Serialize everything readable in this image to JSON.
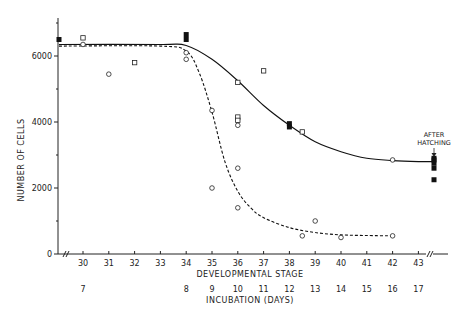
{
  "chart_data": {
    "type": "scatter",
    "title": "",
    "ylabel": "NUMBER OF CELLS",
    "xlabel": "DEVELOPMENTAL STAGE",
    "x2label": "INCUBATION (DAYS)",
    "ylim": [
      0,
      7000
    ],
    "yticks": [
      0,
      2000,
      4000,
      6000
    ],
    "yticks_minor": [
      1000,
      3000,
      5000,
      7000
    ],
    "xticks": [
      30,
      31,
      32,
      33,
      34,
      35,
      36,
      37,
      38,
      39,
      40,
      41,
      42,
      43
    ],
    "incubation_days": [
      {
        "stage": 30,
        "day": "7"
      },
      {
        "stage": 34,
        "day": "8"
      },
      {
        "stage": 35,
        "day": "9"
      },
      {
        "stage": 36,
        "day": "10"
      },
      {
        "stage": 37,
        "day": "11"
      },
      {
        "stage": 38,
        "day": "12"
      },
      {
        "stage": 39,
        "day": "13"
      },
      {
        "stage": 40,
        "day": "14"
      },
      {
        "stage": 41,
        "day": "15"
      },
      {
        "stage": 42,
        "day": "16"
      },
      {
        "stage": 43,
        "day": "17"
      }
    ],
    "grid": false,
    "annotation": {
      "text_line1": "AFTER",
      "text_line2": "HATCHING"
    },
    "series": [
      {
        "name": "filled squares",
        "marker": "filled-square",
        "points": [
          [
            29,
            6500
          ],
          [
            34,
            6650
          ],
          [
            34,
            6500
          ],
          [
            38,
            3950
          ],
          [
            38,
            3850
          ],
          [
            44,
            2900
          ],
          [
            44,
            2850
          ],
          [
            44,
            2750
          ],
          [
            44,
            2600
          ],
          [
            44,
            2250
          ]
        ]
      },
      {
        "name": "open squares",
        "marker": "open-square",
        "points": [
          [
            30,
            6550
          ],
          [
            32,
            5800
          ],
          [
            36,
            5200
          ],
          [
            37,
            5550
          ],
          [
            36,
            4150
          ],
          [
            36,
            4050
          ],
          [
            38.5,
            3700
          ]
        ]
      },
      {
        "name": "open circles",
        "marker": "open-circle",
        "points": [
          [
            30,
            6350
          ],
          [
            31,
            5450
          ],
          [
            34,
            6100
          ],
          [
            34,
            5900
          ],
          [
            35,
            4350
          ],
          [
            36,
            3900
          ],
          [
            35,
            2000
          ],
          [
            36,
            2600
          ],
          [
            36,
            1400
          ],
          [
            38.5,
            550
          ],
          [
            39,
            1000
          ],
          [
            40,
            500
          ],
          [
            42,
            2850
          ],
          [
            42,
            550
          ]
        ]
      }
    ],
    "curves": [
      {
        "name": "solid fit",
        "style": "solid",
        "points": [
          [
            29,
            6350
          ],
          [
            33,
            6350
          ],
          [
            34,
            6320
          ],
          [
            35,
            5900
          ],
          [
            36,
            5250
          ],
          [
            37,
            4500
          ],
          [
            38,
            3900
          ],
          [
            39,
            3400
          ],
          [
            40,
            3100
          ],
          [
            41,
            2900
          ],
          [
            42,
            2830
          ],
          [
            43,
            2800
          ],
          [
            44,
            2800
          ]
        ]
      },
      {
        "name": "dashed fit",
        "style": "dashed",
        "points": [
          [
            29,
            6300
          ],
          [
            33,
            6300
          ],
          [
            34,
            6150
          ],
          [
            34.5,
            5500
          ],
          [
            35,
            4300
          ],
          [
            35.5,
            2800
          ],
          [
            36,
            1900
          ],
          [
            36.5,
            1400
          ],
          [
            37,
            1100
          ],
          [
            38,
            800
          ],
          [
            39,
            650
          ],
          [
            40,
            580
          ],
          [
            41,
            560
          ],
          [
            42,
            550
          ]
        ]
      }
    ]
  }
}
